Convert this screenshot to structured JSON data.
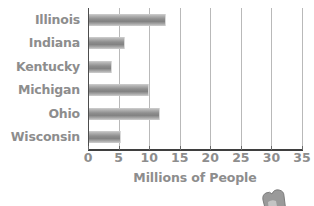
{
  "chart_data": {
    "type": "bar",
    "orientation": "horizontal",
    "title": "",
    "subtitle": "",
    "xlabel": "Millions of People",
    "ylabel": "",
    "categories": [
      "Illinois",
      "Indiana",
      "Kentucky",
      "Michigan",
      "Ohio",
      "Wisconsin"
    ],
    "values": [
      12.7,
      6.0,
      4.0,
      10.0,
      11.8,
      5.4
    ],
    "series": [
      {
        "name": "Population",
        "values": [
          12.7,
          6.0,
          4.0,
          10.0,
          11.8,
          5.4
        ]
      }
    ],
    "xlim": [
      0,
      35
    ],
    "ylim": null,
    "xticks": [
      "0",
      "5",
      "10",
      "15",
      "20",
      "25",
      "30",
      "35"
    ],
    "xtick_values": [
      0,
      5,
      10,
      15,
      20,
      25,
      30,
      35
    ],
    "grid": "vertical",
    "legend": null,
    "legend_position": "none",
    "annotations": [],
    "colors": {
      "bar_light": "#d0d0d0",
      "bar_mid": "#8e8e8e",
      "bar_dark": "#828282",
      "gridline": "#b9b9b9",
      "axis": "#3f3f3f",
      "text": "#8d8d8d",
      "background": "#ffffff"
    }
  },
  "decoration": {
    "corner_graphic": "partial-shape-icon"
  }
}
